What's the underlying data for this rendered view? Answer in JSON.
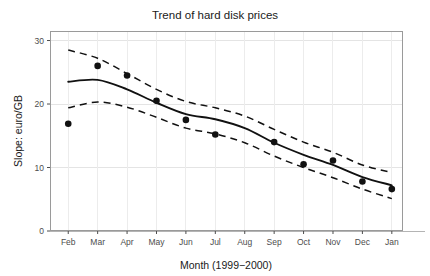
{
  "chart_data": {
    "type": "scatter",
    "title": "Trend of hard disk prices",
    "xlabel": "Month (1999−2000)",
    "ylabel": "Slope: euro/GB",
    "categories": [
      "Feb",
      "Mar",
      "Apr",
      "May",
      "Jun",
      "Jul",
      "Aug",
      "Sep",
      "Oct",
      "Nov",
      "Dec",
      "Jan"
    ],
    "x_tick_labels": [
      "Feb",
      "Mar",
      "Apr",
      "May",
      "Jun",
      "Jul",
      "Aug",
      "Sep",
      "Oct",
      "Nov",
      "Dec",
      "Jan"
    ],
    "y_tick_labels": [
      "0",
      "10",
      "20",
      "30"
    ],
    "y_ticks": [
      0,
      10,
      20,
      30
    ],
    "ylim": [
      0,
      31.5
    ],
    "xlim": [
      0.55,
      12.55
    ],
    "grid": "light vertical and horizontal gridlines",
    "legend": "none",
    "series": [
      {
        "name": "Observed slope",
        "type": "scatter",
        "marker": "filled-circle",
        "color": "#111111",
        "x": [
          "Feb",
          "Mar",
          "Apr",
          "May",
          "Jun",
          "Jul",
          "Aug",
          "Sep",
          "Oct",
          "Nov",
          "Dec",
          "Jan"
        ],
        "values": [
          16.9,
          26.0,
          24.5,
          20.5,
          17.5,
          15.2,
          null,
          14.0,
          10.5,
          11.1,
          7.8,
          6.6
        ]
      },
      {
        "name": "Smoothed trend",
        "type": "line",
        "style": "solid",
        "color": "#111111",
        "x": [
          "Feb",
          "Mar",
          "Apr",
          "May",
          "Jun",
          "Jul",
          "Aug",
          "Sep",
          "Oct",
          "Nov",
          "Dec",
          "Jan"
        ],
        "values": [
          23.5,
          23.8,
          22.3,
          20.2,
          18.4,
          17.6,
          16.2,
          13.9,
          12.0,
          10.4,
          8.5,
          7.2
        ]
      },
      {
        "name": "Upper confidence band",
        "type": "line",
        "style": "dashed",
        "color": "#111111",
        "x": [
          "Feb",
          "Mar",
          "Apr",
          "May",
          "Jun",
          "Jul",
          "Aug",
          "Sep",
          "Oct",
          "Nov",
          "Dec",
          "Jan"
        ],
        "values": [
          28.5,
          27.2,
          24.8,
          22.3,
          20.4,
          19.4,
          18.1,
          16.0,
          14.0,
          12.4,
          10.4,
          9.2
        ]
      },
      {
        "name": "Lower confidence band",
        "type": "line",
        "style": "dashed",
        "color": "#111111",
        "x": [
          "Feb",
          "Mar",
          "Apr",
          "May",
          "Jun",
          "Jul",
          "Aug",
          "Sep",
          "Oct",
          "Nov",
          "Dec",
          "Jan"
        ],
        "values": [
          19.4,
          20.3,
          19.5,
          17.9,
          16.2,
          15.3,
          13.9,
          11.8,
          10.0,
          8.4,
          6.6,
          5.1
        ]
      }
    ]
  },
  "figure": {
    "title": "Trend of hard disk prices",
    "x_axis_title": "Month (1999−2000)",
    "y_axis_title": "Slope: euro/GB",
    "background_color": "#ffffff",
    "foreground_color": "#111111",
    "grid_color": "#ececec",
    "border_color": "#9a9a9a"
  }
}
